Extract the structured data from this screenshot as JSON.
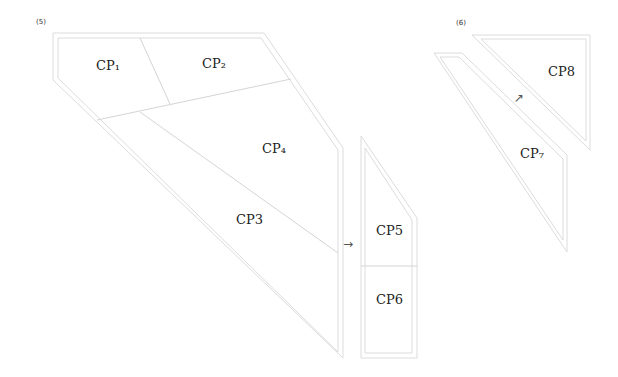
{
  "steps": [
    {
      "label": "(5)"
    },
    {
      "label": "(6)"
    }
  ],
  "pieces": {
    "cp1": "CP₁",
    "cp2": "CP₂",
    "cp3": "CP3",
    "cp4": "CP₄",
    "cp5": "CP5",
    "cp6": "CP6",
    "cp7": "CP₇",
    "cp8": "CP8"
  },
  "arrows": {
    "right": "→",
    "up_right": "↗"
  },
  "colors": {
    "outline": "#dcdcdc",
    "divider": "#d4d4d4",
    "text": "#222222"
  }
}
